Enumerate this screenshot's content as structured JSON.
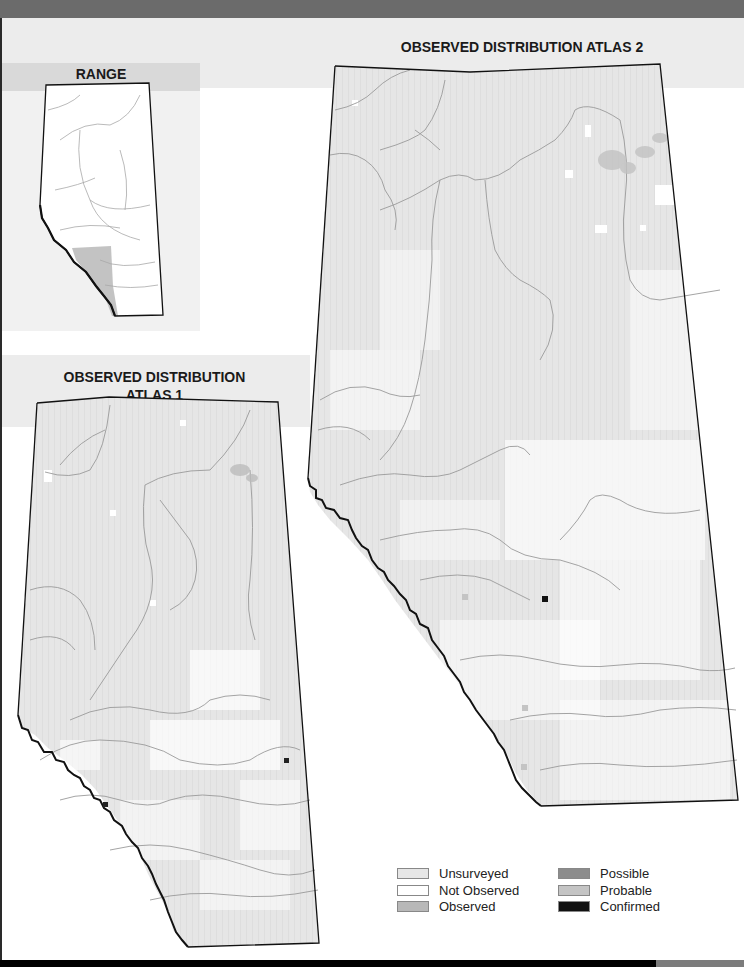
{
  "titles": {
    "range": "RANGE",
    "atlas1_line1": "OBSERVED DISTRIBUTION",
    "atlas1_line2": "ATLAS 1",
    "atlas2": "OBSERVED DISTRIBUTION ATLAS 2"
  },
  "legend": {
    "items": [
      {
        "label": "Unsurveyed",
        "color": "#e6e6e6"
      },
      {
        "label": "Not Observed",
        "color": "#ffffff"
      },
      {
        "label": "Observed",
        "color": "#b8b8b8"
      },
      {
        "label": "Possible",
        "color": "#8c8c8c"
      },
      {
        "label": "Probable",
        "color": "#c4c4c4"
      },
      {
        "label": "Confirmed",
        "color": "#111111"
      }
    ]
  },
  "colors": {
    "top_bar": "#6b6b6b",
    "header_band": "#ececec",
    "range_band": "#d9d9d9",
    "map_fill": "#e6e6e6",
    "range_shade": "#b8b8b8",
    "river": "#9a9a9a",
    "border": "#111111"
  },
  "markers": {
    "atlas1": [
      {
        "type": "Confirmed",
        "x": 106,
        "y": 805
      },
      {
        "type": "Confirmed",
        "x": 287,
        "y": 761
      }
    ],
    "atlas2": [
      {
        "type": "Confirmed",
        "x": 545,
        "y": 599
      },
      {
        "type": "Probable",
        "x": 465,
        "y": 596
      },
      {
        "type": "Probable",
        "x": 525,
        "y": 708
      },
      {
        "type": "Probable",
        "x": 524,
        "y": 767
      }
    ]
  }
}
